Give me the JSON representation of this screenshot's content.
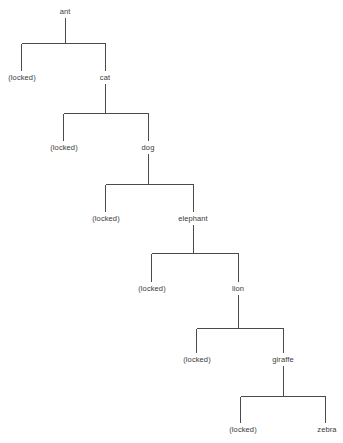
{
  "diagram": {
    "type": "tree",
    "title": "",
    "background_color": "#ffffff",
    "line_color": "#4a4a4a",
    "text_color": "#3a3a3a",
    "locked_label": "(locked)",
    "nodes": [
      {
        "id": "ant",
        "label": "ant",
        "x": 65,
        "y": 12,
        "depth": 0
      },
      {
        "id": "l1",
        "label": "(locked)",
        "x": 22,
        "y": 78,
        "depth": 1
      },
      {
        "id": "cat",
        "label": "cat",
        "x": 105,
        "y": 78,
        "depth": 1
      },
      {
        "id": "l2",
        "label": "(locked)",
        "x": 64,
        "y": 148,
        "depth": 2
      },
      {
        "id": "dog",
        "label": "dog",
        "x": 148,
        "y": 148,
        "depth": 2
      },
      {
        "id": "l3",
        "label": "(locked)",
        "x": 106,
        "y": 219,
        "depth": 3
      },
      {
        "id": "elephant",
        "label": "elephant",
        "x": 193,
        "y": 219,
        "depth": 3
      },
      {
        "id": "l4",
        "label": "(locked)",
        "x": 152,
        "y": 289,
        "depth": 4
      },
      {
        "id": "lion",
        "label": "lion",
        "x": 238,
        "y": 289,
        "depth": 4
      },
      {
        "id": "l5",
        "label": "(locked)",
        "x": 197,
        "y": 360,
        "depth": 5
      },
      {
        "id": "giraffe",
        "label": "giraffe",
        "x": 283,
        "y": 360,
        "depth": 5
      },
      {
        "id": "l6",
        "label": "(locked)",
        "x": 243,
        "y": 430,
        "depth": 6
      },
      {
        "id": "zebra",
        "label": "zebra",
        "x": 327,
        "y": 430,
        "depth": 6
      }
    ],
    "branches": [
      {
        "parent": "ant",
        "stem_x": 65,
        "stem_top": 18,
        "bar_y": 43,
        "bar_left": 21,
        "bar_right": 105,
        "child_bottom": 71,
        "left_child": "l1",
        "right_child": "cat"
      },
      {
        "parent": "cat",
        "stem_x": 105,
        "stem_top": 84,
        "bar_y": 113,
        "bar_left": 63,
        "bar_right": 148,
        "child_bottom": 141,
        "left_child": "l2",
        "right_child": "dog"
      },
      {
        "parent": "dog",
        "stem_x": 148,
        "stem_top": 154,
        "bar_y": 184,
        "bar_left": 105,
        "bar_right": 193,
        "child_bottom": 212,
        "left_child": "l3",
        "right_child": "elephant"
      },
      {
        "parent": "elephant",
        "stem_x": 193,
        "stem_top": 225,
        "bar_y": 253,
        "bar_left": 151,
        "bar_right": 238,
        "child_bottom": 282,
        "left_child": "l4",
        "right_child": "lion"
      },
      {
        "parent": "lion",
        "stem_x": 238,
        "stem_top": 295,
        "bar_y": 328,
        "bar_left": 196,
        "bar_right": 283,
        "child_bottom": 353,
        "left_child": "l5",
        "right_child": "giraffe"
      },
      {
        "parent": "giraffe",
        "stem_x": 283,
        "stem_top": 366,
        "bar_y": 396,
        "bar_left": 240,
        "bar_right": 325,
        "child_bottom": 423,
        "left_child": "l6",
        "right_child": "zebra"
      }
    ]
  }
}
